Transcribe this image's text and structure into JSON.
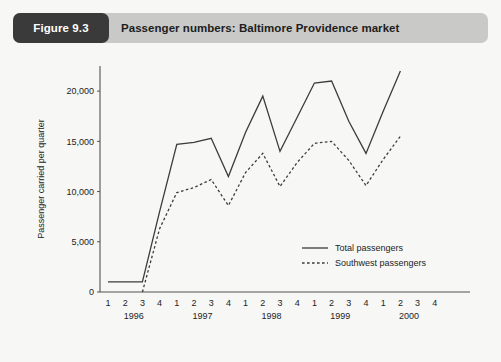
{
  "figure": {
    "tag": "Figure 9.3",
    "title": "Passenger numbers: Baltimore Providence market"
  },
  "chart_data": {
    "type": "line",
    "title": "Passenger numbers: Baltimore Providence market",
    "xlabel": "",
    "ylabel": "Passenger carried per quarter",
    "ylim": [
      0,
      22500
    ],
    "yticks": [
      0,
      5000,
      10000,
      15000,
      20000
    ],
    "ytick_labels": [
      "0",
      "5,000",
      "10,000",
      "15,000",
      "20,000"
    ],
    "grid": false,
    "legend_position": "inside-lower-right",
    "x": [
      "1996 Q1",
      "1996 Q2",
      "1996 Q3",
      "1996 Q4",
      "1997 Q1",
      "1997 Q2",
      "1997 Q3",
      "1997 Q4",
      "1998 Q1",
      "1998 Q2",
      "1998 Q3",
      "1998 Q4",
      "1999 Q1",
      "1999 Q2",
      "1999 Q3",
      "1999 Q4",
      "2000 Q1",
      "2000 Q2",
      "2000 Q3",
      "2000 Q4"
    ],
    "quarter_labels": [
      "1",
      "2",
      "3",
      "4",
      "1",
      "2",
      "3",
      "4",
      "1",
      "2",
      "3",
      "4",
      "1",
      "2",
      "3",
      "4",
      "1",
      "2",
      "3",
      "4"
    ],
    "year_labels": [
      "1996",
      "1997",
      "1998",
      "1999",
      "2000"
    ],
    "series": [
      {
        "name": "Total passengers",
        "style": "solid",
        "values": [
          1000,
          1000,
          1000,
          8000,
          14700,
          14900,
          15300,
          11500,
          15900,
          19500,
          14000,
          17400,
          20800,
          21000,
          17000,
          13800,
          18000,
          22000,
          null,
          null
        ]
      },
      {
        "name": "Southwest passengers",
        "style": "dashed",
        "values": [
          null,
          null,
          0,
          6300,
          9900,
          10400,
          11200,
          8600,
          11900,
          13800,
          10500,
          12900,
          14800,
          15000,
          13100,
          10600,
          13200,
          15500,
          null,
          null
        ]
      }
    ]
  },
  "legend": {
    "items": [
      {
        "label": "Total passengers",
        "style": "solid"
      },
      {
        "label": "Southwest passengers",
        "style": "dashed"
      }
    ]
  }
}
